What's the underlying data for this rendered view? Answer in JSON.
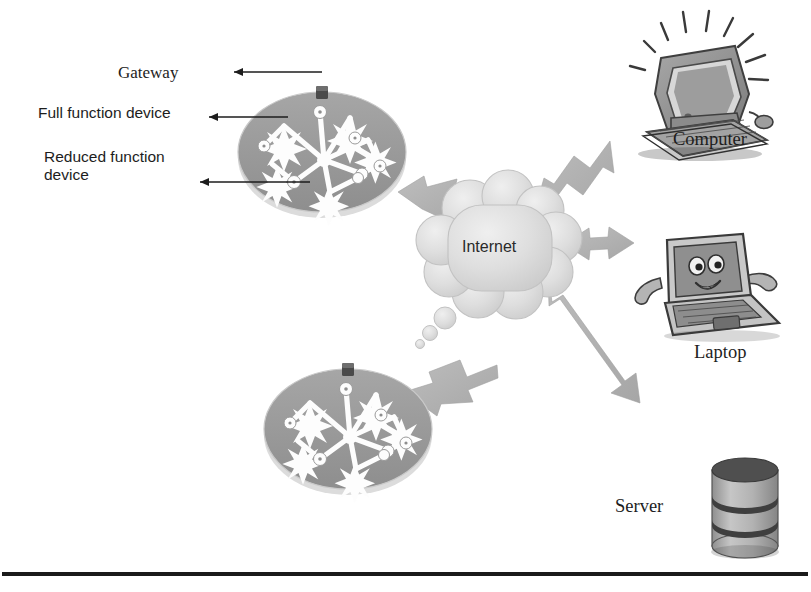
{
  "diagram": {
    "background_color": "#ffffff",
    "rule_color": "#1a1a1a"
  },
  "labels": {
    "gateway": "Gateway",
    "full_function_device": "Full function device",
    "reduced_function_device_line1": "Reduced function",
    "reduced_function_device_line2": "device",
    "internet": "Internet",
    "computer": "Computer",
    "laptop": "Laptop",
    "server": "Server"
  },
  "colors": {
    "disc_fill": "#9a9a9a",
    "disc_rim": "#d8d8d8",
    "node_white": "#fdfdfd",
    "gateway_tab": "#4a4a4a",
    "cloud_fill": "#d9d9d9",
    "cloud_highlight": "#ececec",
    "arrow_fill": "#b3b3b3",
    "text": "#1d1d1d",
    "server_top": "#4f4f4f",
    "server_body": "#b0b0b0",
    "monitor_body": "#8f8f8f",
    "laptop_screen": "#8a8a8a"
  },
  "nodes": [
    {
      "name": "wsn-cluster-top",
      "type": "sensor-network-disc",
      "label": ""
    },
    {
      "name": "wsn-cluster-bottom",
      "type": "sensor-network-disc",
      "label": ""
    },
    {
      "name": "internet-cloud",
      "type": "cloud",
      "label": "Internet"
    },
    {
      "name": "computer",
      "type": "desktop-computer",
      "label": "Computer"
    },
    {
      "name": "laptop",
      "type": "laptop",
      "label": "Laptop"
    },
    {
      "name": "server",
      "type": "database-cylinder",
      "label": "Server"
    }
  ],
  "connections": [
    {
      "from": "wsn-cluster-top",
      "to": "internet-cloud",
      "style": "double-arrow"
    },
    {
      "from": "wsn-cluster-bottom",
      "to": "internet-cloud",
      "style": "double-arrow"
    },
    {
      "from": "internet-cloud",
      "to": "computer",
      "style": "double-arrow"
    },
    {
      "from": "internet-cloud",
      "to": "laptop",
      "style": "double-arrow"
    },
    {
      "from": "internet-cloud",
      "to": "server",
      "style": "double-arrow"
    }
  ],
  "callouts": [
    {
      "name": "gateway-callout",
      "target": "gateway-tab",
      "label": "Gateway"
    },
    {
      "name": "ffd-callout",
      "target": "star-node",
      "label": "Full function device"
    },
    {
      "name": "rfd-callout",
      "target": "circle-node",
      "label": "Reduced function device"
    }
  ]
}
